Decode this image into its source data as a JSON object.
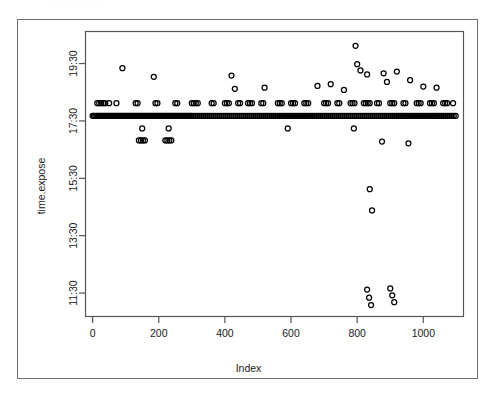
{
  "artifact_text": "·  ·     ·   ·       ·     ·        ·",
  "chart_data": {
    "type": "scatter",
    "title": "",
    "xlabel": "Index",
    "ylabel": "time.expose",
    "xlim": [
      -20,
      1120
    ],
    "ylim_labels": [
      "11:30",
      "13:30",
      "15:30",
      "17:30",
      "19:30"
    ],
    "xticks": [
      0,
      200,
      400,
      600,
      800,
      1000
    ],
    "xticklabels": [
      "0",
      "200",
      "400",
      "600",
      "800",
      "1000"
    ],
    "yticks": [
      11.5,
      13.5,
      15.5,
      17.5,
      19.5
    ],
    "yticklabels": [
      "11:30",
      "13:30",
      "15:30",
      "17:30",
      "19:30"
    ],
    "ylim": [
      10.7,
      20.6
    ],
    "grid": false,
    "legend": null,
    "point_marker": "open-circle",
    "point_color": "#000000",
    "n_points_approx": 1100,
    "bands": [
      {
        "name": "main-dense-band",
        "y_value": 17.68,
        "x_from": 0,
        "x_to": 1100,
        "density": "very-high"
      },
      {
        "name": "secondary-band",
        "y_value": 18.12,
        "x_from": 0,
        "x_to": 1100,
        "density": "high"
      },
      {
        "name": "lower-band",
        "y_value": 16.82,
        "x_from": 130,
        "x_to": 250,
        "density": "medium"
      }
    ],
    "points": [
      [
        0,
        17.68
      ],
      [
        4,
        17.68
      ],
      [
        8,
        17.68
      ],
      [
        12,
        17.68
      ],
      [
        16,
        17.68
      ],
      [
        20,
        17.68
      ],
      [
        24,
        17.68
      ],
      [
        28,
        17.68
      ],
      [
        32,
        17.68
      ],
      [
        36,
        17.68
      ],
      [
        40,
        17.68
      ],
      [
        44,
        17.68
      ],
      [
        48,
        17.68
      ],
      [
        52,
        17.68
      ],
      [
        56,
        17.68
      ],
      [
        60,
        17.68
      ],
      [
        64,
        17.68
      ],
      [
        68,
        17.68
      ],
      [
        72,
        17.68
      ],
      [
        76,
        17.68
      ],
      [
        80,
        17.68
      ],
      [
        84,
        17.68
      ],
      [
        88,
        17.68
      ],
      [
        92,
        17.68
      ],
      [
        96,
        17.68
      ],
      [
        100,
        17.68
      ],
      [
        104,
        17.68
      ],
      [
        108,
        17.68
      ],
      [
        112,
        17.68
      ],
      [
        116,
        17.68
      ],
      [
        120,
        17.68
      ],
      [
        124,
        17.68
      ],
      [
        128,
        17.68
      ],
      [
        132,
        17.68
      ],
      [
        136,
        17.68
      ],
      [
        140,
        17.68
      ],
      [
        144,
        17.68
      ],
      [
        148,
        17.68
      ],
      [
        152,
        17.68
      ],
      [
        156,
        17.68
      ],
      [
        160,
        17.68
      ],
      [
        164,
        17.68
      ],
      [
        168,
        17.68
      ],
      [
        172,
        17.68
      ],
      [
        176,
        17.68
      ],
      [
        180,
        17.68
      ],
      [
        184,
        17.68
      ],
      [
        188,
        17.68
      ],
      [
        192,
        17.68
      ],
      [
        196,
        17.68
      ],
      [
        200,
        17.68
      ],
      [
        204,
        17.68
      ],
      [
        208,
        17.68
      ],
      [
        212,
        17.68
      ],
      [
        216,
        17.68
      ],
      [
        220,
        17.68
      ],
      [
        224,
        17.68
      ],
      [
        228,
        17.68
      ],
      [
        232,
        17.68
      ],
      [
        236,
        17.68
      ],
      [
        240,
        17.68
      ],
      [
        244,
        17.68
      ],
      [
        248,
        17.68
      ],
      [
        252,
        17.68
      ],
      [
        256,
        17.68
      ],
      [
        260,
        17.68
      ],
      [
        264,
        17.68
      ],
      [
        268,
        17.68
      ],
      [
        272,
        17.68
      ],
      [
        276,
        17.68
      ],
      [
        280,
        17.68
      ],
      [
        284,
        17.68
      ],
      [
        288,
        17.68
      ],
      [
        292,
        17.68
      ],
      [
        296,
        17.68
      ],
      [
        300,
        17.68
      ],
      [
        306,
        17.68
      ],
      [
        312,
        17.68
      ],
      [
        318,
        17.68
      ],
      [
        324,
        17.68
      ],
      [
        330,
        17.68
      ],
      [
        336,
        17.68
      ],
      [
        342,
        17.68
      ],
      [
        348,
        17.68
      ],
      [
        354,
        17.68
      ],
      [
        360,
        17.68
      ],
      [
        366,
        17.68
      ],
      [
        372,
        17.68
      ],
      [
        378,
        17.68
      ],
      [
        384,
        17.68
      ],
      [
        390,
        17.68
      ],
      [
        396,
        17.68
      ],
      [
        402,
        17.68
      ],
      [
        408,
        17.68
      ],
      [
        414,
        17.68
      ],
      [
        420,
        17.68
      ],
      [
        426,
        17.68
      ],
      [
        432,
        17.68
      ],
      [
        438,
        17.68
      ],
      [
        444,
        17.68
      ],
      [
        450,
        17.68
      ],
      [
        456,
        17.68
      ],
      [
        462,
        17.68
      ],
      [
        468,
        17.68
      ],
      [
        474,
        17.68
      ],
      [
        480,
        17.68
      ],
      [
        486,
        17.68
      ],
      [
        492,
        17.68
      ],
      [
        498,
        17.68
      ],
      [
        504,
        17.68
      ],
      [
        510,
        17.68
      ],
      [
        516,
        17.68
      ],
      [
        522,
        17.68
      ],
      [
        528,
        17.68
      ],
      [
        534,
        17.68
      ],
      [
        540,
        17.68
      ],
      [
        546,
        17.68
      ],
      [
        552,
        17.68
      ],
      [
        558,
        17.68
      ],
      [
        564,
        17.68
      ],
      [
        570,
        17.68
      ],
      [
        576,
        17.68
      ],
      [
        582,
        17.68
      ],
      [
        588,
        17.68
      ],
      [
        594,
        17.68
      ],
      [
        600,
        17.68
      ],
      [
        606,
        17.68
      ],
      [
        612,
        17.68
      ],
      [
        618,
        17.68
      ],
      [
        624,
        17.68
      ],
      [
        630,
        17.68
      ],
      [
        636,
        17.68
      ],
      [
        642,
        17.68
      ],
      [
        648,
        17.68
      ],
      [
        654,
        17.68
      ],
      [
        660,
        17.68
      ],
      [
        666,
        17.68
      ],
      [
        672,
        17.68
      ],
      [
        678,
        17.68
      ],
      [
        684,
        17.68
      ],
      [
        690,
        17.68
      ],
      [
        696,
        17.68
      ],
      [
        702,
        17.68
      ],
      [
        708,
        17.68
      ],
      [
        714,
        17.68
      ],
      [
        720,
        17.68
      ],
      [
        726,
        17.68
      ],
      [
        732,
        17.68
      ],
      [
        738,
        17.68
      ],
      [
        744,
        17.68
      ],
      [
        750,
        17.68
      ],
      [
        756,
        17.68
      ],
      [
        762,
        17.68
      ],
      [
        768,
        17.68
      ],
      [
        774,
        17.68
      ],
      [
        780,
        17.68
      ],
      [
        786,
        17.68
      ],
      [
        792,
        17.68
      ],
      [
        798,
        17.68
      ],
      [
        804,
        17.68
      ],
      [
        810,
        17.68
      ],
      [
        816,
        17.68
      ],
      [
        822,
        17.68
      ],
      [
        828,
        17.68
      ],
      [
        834,
        17.68
      ],
      [
        840,
        17.68
      ],
      [
        846,
        17.68
      ],
      [
        852,
        17.68
      ],
      [
        858,
        17.68
      ],
      [
        864,
        17.68
      ],
      [
        870,
        17.68
      ],
      [
        876,
        17.68
      ],
      [
        882,
        17.68
      ],
      [
        888,
        17.68
      ],
      [
        894,
        17.68
      ],
      [
        900,
        17.68
      ],
      [
        906,
        17.68
      ],
      [
        912,
        17.68
      ],
      [
        918,
        17.68
      ],
      [
        924,
        17.68
      ],
      [
        930,
        17.68
      ],
      [
        936,
        17.68
      ],
      [
        942,
        17.68
      ],
      [
        948,
        17.68
      ],
      [
        954,
        17.68
      ],
      [
        960,
        17.68
      ],
      [
        966,
        17.68
      ],
      [
        972,
        17.68
      ],
      [
        978,
        17.68
      ],
      [
        984,
        17.68
      ],
      [
        990,
        17.68
      ],
      [
        996,
        17.68
      ],
      [
        1002,
        17.68
      ],
      [
        1008,
        17.68
      ],
      [
        1014,
        17.68
      ],
      [
        1020,
        17.68
      ],
      [
        1026,
        17.68
      ],
      [
        1032,
        17.68
      ],
      [
        1038,
        17.68
      ],
      [
        1044,
        17.68
      ],
      [
        1050,
        17.68
      ],
      [
        1056,
        17.68
      ],
      [
        1062,
        17.68
      ],
      [
        1068,
        17.68
      ],
      [
        1074,
        17.68
      ],
      [
        1080,
        17.68
      ],
      [
        1086,
        17.68
      ],
      [
        1092,
        17.68
      ],
      [
        1098,
        17.68
      ],
      [
        14,
        18.12
      ],
      [
        20,
        18.12
      ],
      [
        26,
        18.12
      ],
      [
        32,
        18.12
      ],
      [
        38,
        18.12
      ],
      [
        50,
        18.12
      ],
      [
        72,
        18.12
      ],
      [
        130,
        18.12
      ],
      [
        136,
        18.12
      ],
      [
        190,
        18.12
      ],
      [
        196,
        18.12
      ],
      [
        250,
        18.12
      ],
      [
        256,
        18.12
      ],
      [
        300,
        18.12
      ],
      [
        306,
        18.12
      ],
      [
        312,
        18.12
      ],
      [
        318,
        18.12
      ],
      [
        360,
        18.12
      ],
      [
        366,
        18.12
      ],
      [
        400,
        18.12
      ],
      [
        406,
        18.12
      ],
      [
        412,
        18.12
      ],
      [
        440,
        18.12
      ],
      [
        446,
        18.12
      ],
      [
        470,
        18.12
      ],
      [
        476,
        18.12
      ],
      [
        482,
        18.12
      ],
      [
        510,
        18.12
      ],
      [
        516,
        18.12
      ],
      [
        560,
        18.12
      ],
      [
        566,
        18.12
      ],
      [
        572,
        18.12
      ],
      [
        600,
        18.12
      ],
      [
        606,
        18.12
      ],
      [
        612,
        18.12
      ],
      [
        640,
        18.12
      ],
      [
        646,
        18.12
      ],
      [
        652,
        18.12
      ],
      [
        700,
        18.12
      ],
      [
        706,
        18.12
      ],
      [
        712,
        18.12
      ],
      [
        740,
        18.12
      ],
      [
        746,
        18.12
      ],
      [
        780,
        18.12
      ],
      [
        786,
        18.12
      ],
      [
        792,
        18.12
      ],
      [
        820,
        18.12
      ],
      [
        826,
        18.12
      ],
      [
        832,
        18.12
      ],
      [
        838,
        18.12
      ],
      [
        860,
        18.12
      ],
      [
        866,
        18.12
      ],
      [
        900,
        18.12
      ],
      [
        906,
        18.12
      ],
      [
        912,
        18.12
      ],
      [
        940,
        18.12
      ],
      [
        946,
        18.12
      ],
      [
        980,
        18.12
      ],
      [
        986,
        18.12
      ],
      [
        992,
        18.12
      ],
      [
        1020,
        18.12
      ],
      [
        1026,
        18.12
      ],
      [
        1032,
        18.12
      ],
      [
        1060,
        18.12
      ],
      [
        1066,
        18.12
      ],
      [
        1072,
        18.12
      ],
      [
        1090,
        18.12
      ],
      [
        140,
        16.82
      ],
      [
        146,
        16.82
      ],
      [
        152,
        16.82
      ],
      [
        158,
        16.82
      ],
      [
        220,
        16.82
      ],
      [
        226,
        16.82
      ],
      [
        232,
        16.82
      ],
      [
        238,
        16.82
      ],
      [
        150,
        17.24
      ],
      [
        230,
        17.24
      ],
      [
        590,
        17.24
      ],
      [
        790,
        17.24
      ],
      [
        90,
        19.34
      ],
      [
        185,
        19.04
      ],
      [
        420,
        19.08
      ],
      [
        430,
        18.62
      ],
      [
        520,
        18.66
      ],
      [
        680,
        18.72
      ],
      [
        720,
        18.78
      ],
      [
        760,
        18.58
      ],
      [
        800,
        19.48
      ],
      [
        810,
        19.26
      ],
      [
        830,
        19.12
      ],
      [
        880,
        19.16
      ],
      [
        890,
        18.86
      ],
      [
        920,
        19.22
      ],
      [
        960,
        18.92
      ],
      [
        1000,
        18.7
      ],
      [
        1040,
        18.66
      ],
      [
        795,
        20.12
      ],
      [
        838,
        15.12
      ],
      [
        845,
        14.38
      ],
      [
        830,
        11.62
      ],
      [
        836,
        11.34
      ],
      [
        842,
        11.08
      ],
      [
        900,
        11.66
      ],
      [
        906,
        11.42
      ],
      [
        912,
        11.18
      ],
      [
        875,
        16.78
      ],
      [
        955,
        16.72
      ]
    ]
  }
}
